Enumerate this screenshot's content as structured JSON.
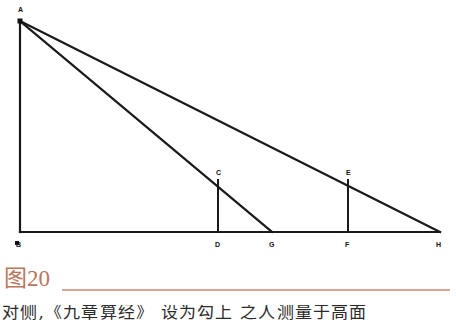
{
  "figure": {
    "name": "triangle-diagram-figure-20",
    "background_color": "#ffffff",
    "line_color": "#1a1a1a",
    "vertices": {
      "A": {
        "label": "A",
        "x": 20,
        "y": 21,
        "label_x": 18,
        "label_y": 12
      },
      "B": {
        "label": "B",
        "x": 20,
        "y": 232,
        "label_x": 16,
        "label_y": 244
      },
      "C": {
        "label": "C",
        "x": 218,
        "y": 180,
        "label_x": 216,
        "label_y": 174
      },
      "D": {
        "label": "D",
        "x": 218,
        "y": 232,
        "label_x": 215,
        "label_y": 244
      },
      "E": {
        "label": "E",
        "x": 348,
        "y": 180,
        "label_x": 346,
        "label_y": 174
      },
      "F": {
        "label": "F",
        "x": 348,
        "y": 232,
        "label_x": 345,
        "label_y": 244
      },
      "G": {
        "label": "G",
        "x": 272,
        "y": 232,
        "label_x": 269,
        "label_y": 244
      },
      "H": {
        "label": "H",
        "x": 440,
        "y": 232,
        "label_x": 437,
        "label_y": 244
      }
    },
    "segments": [
      {
        "name": "segment-AB-vertical-left",
        "from": "A",
        "to": "B"
      },
      {
        "name": "segment-BH-baseline",
        "from": "B",
        "to": "H"
      },
      {
        "name": "segment-AH-hypotenuse",
        "from": "A",
        "to": "H"
      },
      {
        "name": "segment-AG-inner-diagonal",
        "from": "A",
        "to": "G"
      },
      {
        "name": "segment-CD-vertical",
        "from": "C",
        "to": "D"
      },
      {
        "name": "segment-EF-vertical",
        "from": "E",
        "to": "F"
      }
    ]
  },
  "caption": {
    "text": "图20",
    "color": "#b9765c",
    "rule_color": "#d8a896"
  },
  "body_text": {
    "clipped_line": "对侧,《九章算经》 设为勾上  之人测量于高面"
  }
}
